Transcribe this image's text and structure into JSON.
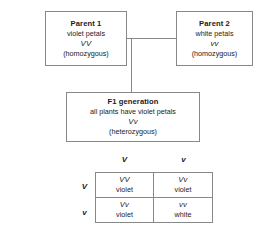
{
  "diagram": {
    "parent1": {
      "title": "Parent 1",
      "phenotype": "violet petals",
      "genotype": "VV",
      "zygosity": "(homozygous)"
    },
    "parent2": {
      "title": "Parent 2",
      "phenotype": "white petals",
      "genotype": "vv",
      "zygosity": "(homozygous)"
    },
    "f1": {
      "title": "F1 generation",
      "phenotype": "all plants have violet petals",
      "genotype": "Vv",
      "zygosity": "(heterozygous)"
    },
    "punnett": {
      "column_headers": [
        "V",
        "v"
      ],
      "row_headers": [
        "V",
        "v"
      ],
      "cells": [
        {
          "genotype": "VV",
          "phenotype": "violet"
        },
        {
          "genotype": "Vv",
          "phenotype": "violet"
        },
        {
          "genotype": "Vv",
          "phenotype": "violet"
        },
        {
          "genotype": "vv",
          "phenotype": "white"
        }
      ]
    },
    "colors": {
      "line": "#888888",
      "text": "#1a1a1a",
      "background": "#ffffff"
    }
  }
}
